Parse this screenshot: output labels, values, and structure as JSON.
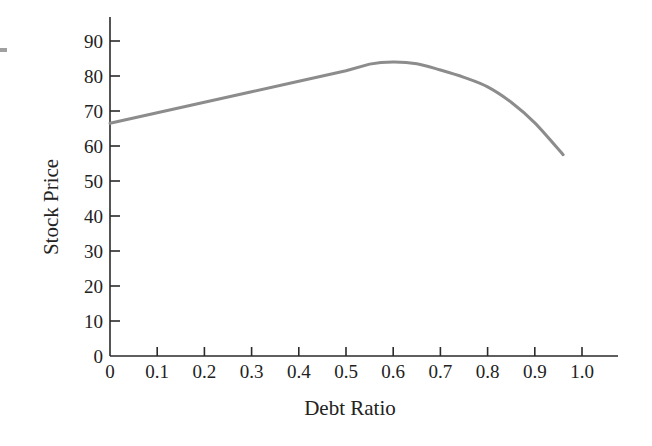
{
  "chart_data": {
    "type": "line",
    "title": "",
    "xlabel": "Debt Ratio",
    "ylabel": "Stock Price",
    "xlim": [
      0,
      1.1
    ],
    "ylim": [
      0,
      95
    ],
    "x_ticks": [
      0,
      0.1,
      0.2,
      0.3,
      0.4,
      0.5,
      0.6,
      0.7,
      0.8,
      0.9,
      1.0
    ],
    "x_tick_labels": [
      "0",
      "0.1",
      "0.2",
      "0.3",
      "0.4",
      "0.5",
      "0.6",
      "0.7",
      "0.8",
      "0.9",
      "1.0"
    ],
    "y_ticks": [
      0,
      10,
      20,
      30,
      40,
      50,
      60,
      70,
      80,
      90
    ],
    "y_tick_labels": [
      "0",
      "10",
      "20",
      "30",
      "40",
      "50",
      "60",
      "70",
      "80",
      "90"
    ],
    "grid": false,
    "legend": null,
    "series": [
      {
        "name": "Stock Price",
        "color": "#8c8c8c",
        "x": [
          0,
          0.1,
          0.2,
          0.3,
          0.4,
          0.5,
          0.55,
          0.6,
          0.65,
          0.7,
          0.75,
          0.8,
          0.85,
          0.9,
          0.96
        ],
        "y": [
          66.5,
          69.5,
          72.5,
          75.5,
          78.5,
          81.5,
          83.4,
          84.0,
          83.5,
          81.7,
          79.6,
          76.9,
          72.5,
          66.6,
          57.5
        ]
      }
    ]
  },
  "colors": {
    "axis": "#2a2a2a",
    "text": "#222222",
    "curve": "#8c8c8c",
    "background": "#ffffff"
  }
}
